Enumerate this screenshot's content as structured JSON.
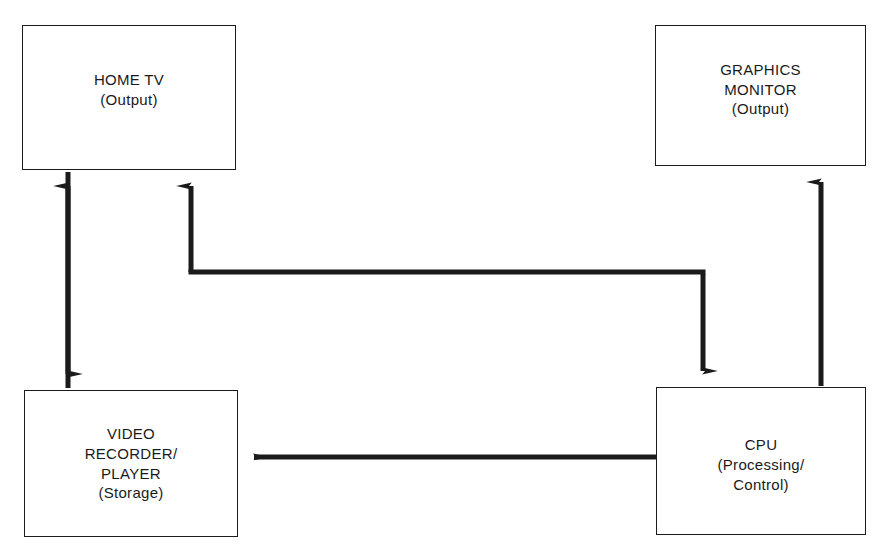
{
  "diagram": {
    "background_color": "#ffffff",
    "line_color": "#1b1b1b",
    "nodes": [
      {
        "id": "home-tv",
        "name": "HOME TV",
        "role": "(Output)",
        "x": 22,
        "y": 25,
        "width": 214,
        "height": 145
      },
      {
        "id": "graphics-monitor",
        "name_line1": "GRAPHICS",
        "name_line2": "MONITOR",
        "role": "(Output)",
        "x": 655,
        "y": 25,
        "width": 211,
        "height": 141
      },
      {
        "id": "video-recorder",
        "name_line1": "VIDEO",
        "name_line2": "RECORDER/",
        "name_line3": "PLAYER",
        "role": "(Storage)",
        "x": 24,
        "y": 390,
        "width": 214,
        "height": 147
      },
      {
        "id": "cpu",
        "name": "CPU",
        "role_line1": "(Processing/",
        "role_line2": "Control)",
        "x": 656,
        "y": 387,
        "width": 210,
        "height": 148
      }
    ],
    "edges": [
      {
        "id": "tv-recorder-link",
        "from": "home-tv",
        "to": "video-recorder",
        "arrowheads": "both",
        "orientation": "vertical"
      },
      {
        "id": "cpu-tv-link",
        "from": "cpu",
        "to": "home-tv",
        "arrowheads": "both",
        "orientation": "elbow"
      },
      {
        "id": "cpu-monitor-link",
        "from": "cpu",
        "to": "graphics-monitor",
        "arrowheads": "end",
        "orientation": "vertical"
      },
      {
        "id": "cpu-recorder-link",
        "from": "cpu",
        "to": "video-recorder",
        "arrowheads": "end",
        "orientation": "horizontal"
      }
    ]
  }
}
